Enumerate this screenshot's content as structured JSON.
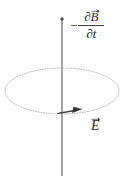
{
  "figure": {
    "type": "physics-diagram",
    "background_color": "#ffffff",
    "width": 123,
    "height": 176
  },
  "axis": {
    "name": "vertical-axis",
    "color": "#8a8a8a",
    "x": 62,
    "y_top": 18,
    "y_bottom": 176,
    "cap": "dot"
  },
  "flux_label": {
    "minus": "−",
    "numerator_symbol": "∂B",
    "numerator_partial": "∂",
    "numerator_field": "B",
    "denominator": "∂t",
    "denominator_partial": "∂",
    "denominator_variable": "t",
    "full_text": "−∂B⃗/∂t",
    "color": "#2b2b2b"
  },
  "efield_label": {
    "symbol": "E",
    "full_text": "E⃗",
    "color": "#2b2b2b"
  },
  "loop": {
    "name": "electric-field-loop",
    "style": "dotted",
    "color": "#b0b0b0",
    "center_x": 62,
    "center_y": 91,
    "radius_x": 57,
    "radius_y": 23
  },
  "direction_arrow": {
    "name": "field-direction-arrow",
    "color": "#3a3a3a",
    "points": "right",
    "tip_x": 80,
    "tip_y": 110
  }
}
